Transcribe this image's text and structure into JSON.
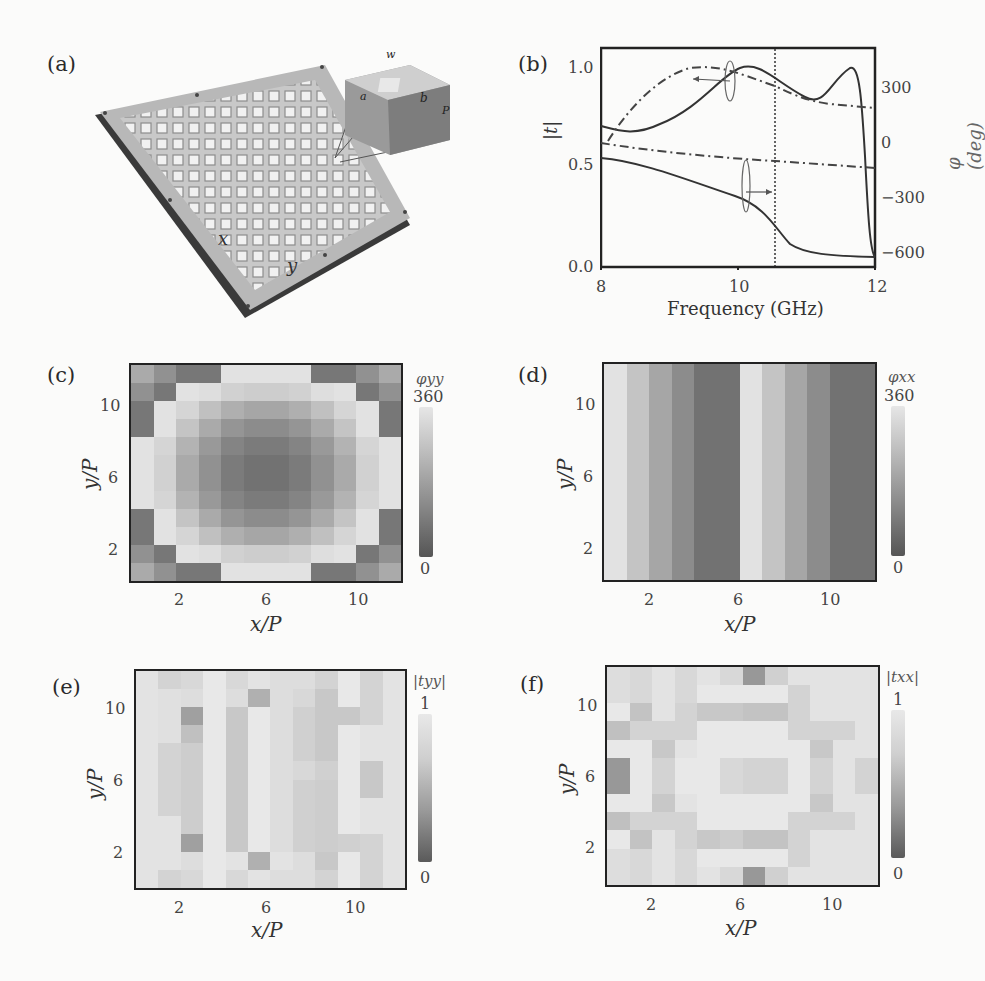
{
  "panels": {
    "a": {
      "label": "(a)",
      "description": "Photograph of fabricated metasurface sample (12x12 unit cells) with inset unit-cell schematic",
      "inset_dimension_labels": [
        "w",
        "a",
        "a'",
        "b",
        "b'",
        "P"
      ],
      "axis_labels": [
        "x",
        "y"
      ]
    },
    "b": {
      "label": "(b)",
      "xlabel": "Frequency (GHz)",
      "ylabel_left": "|t|",
      "ylabel_right": "φ (deg)",
      "xticks": [
        "8",
        "10",
        "12"
      ],
      "yticks_left": [
        "0.0",
        "0.5",
        "1.0"
      ],
      "yticks_right": [
        "300",
        "0",
        "−300",
        "−600"
      ]
    },
    "c": {
      "label": "(c)",
      "xlabel": "x/P",
      "ylabel": "y/P",
      "xticks": [
        "2",
        "6",
        "10"
      ],
      "yticks": [
        "10",
        "6",
        "2"
      ],
      "cbar_title": "φyy",
      "cbar_max": "360",
      "cbar_min": "0"
    },
    "d": {
      "label": "(d)",
      "xlabel": "x/P",
      "ylabel": "y/P",
      "xticks": [
        "2",
        "6",
        "10"
      ],
      "yticks": [
        "10",
        "6",
        "2"
      ],
      "cbar_title": "φxx",
      "cbar_max": "360",
      "cbar_min": "0"
    },
    "e": {
      "label": "(e)",
      "xlabel": "x/P",
      "ylabel": "y/P",
      "xticks": [
        "2",
        "6",
        "10"
      ],
      "yticks": [
        "10",
        "6",
        "2"
      ],
      "cbar_title": "|tyy|",
      "cbar_max": "1",
      "cbar_min": "0"
    },
    "f": {
      "label": "(f)",
      "xlabel": "x/P",
      "ylabel": "y/P",
      "xticks": [
        "2",
        "6",
        "10"
      ],
      "yticks": [
        "10",
        "6",
        "2"
      ],
      "cbar_title": "|txx|",
      "cbar_max": "1",
      "cbar_min": "0"
    }
  },
  "chart_data": [
    {
      "panel": "b",
      "type": "line",
      "title": "",
      "xlabel": "Frequency (GHz)",
      "ylabel": "|t|",
      "ylabel_right": "φ (deg)",
      "xlim": [
        8,
        12
      ],
      "ylim": [
        0,
        1.1
      ],
      "ylim_right": [
        -650,
        500
      ],
      "vline": 10.55,
      "x": [
        8.0,
        8.25,
        8.5,
        8.75,
        9.0,
        9.25,
        9.5,
        9.75,
        10.0,
        10.25,
        10.5,
        10.75,
        11.0,
        11.25,
        11.5,
        11.65,
        11.75,
        11.85,
        12.0
      ],
      "series": [
        {
          "name": "|t| (upper, solid)",
          "axis": "left",
          "style": "solid",
          "values": [
            0.7,
            0.68,
            0.67,
            0.69,
            0.74,
            0.81,
            0.88,
            0.94,
            0.99,
            1.0,
            0.95,
            0.88,
            0.84,
            0.88,
            0.99,
            0.98,
            0.7,
            0.3,
            0.06
          ]
        },
        {
          "name": "φ (upper, dash-dot)",
          "axis": "right",
          "style": "dashdot",
          "values": [
            -20,
            20,
            170,
            290,
            350,
            380,
            390,
            380,
            360,
            340,
            310,
            270,
            250,
            230,
            220,
            215,
            212,
            210,
            210
          ]
        },
        {
          "name": "|t| (lower, solid)",
          "axis": "left",
          "style": "solid",
          "values": [
            0.51,
            0.5,
            0.49,
            0.47,
            0.45,
            0.42,
            0.4,
            0.38,
            0.36,
            0.33,
            0.28,
            0.18,
            0.1,
            0.08,
            0.07,
            0.065,
            0.06,
            0.06,
            0.06
          ]
        },
        {
          "name": "φ (lower, dash-dot)",
          "axis": "right",
          "style": "dashdot",
          "values": [
            -5,
            -20,
            -35,
            -50,
            -65,
            -75,
            -85,
            -95,
            -105,
            -112,
            -118,
            -125,
            -130,
            -135,
            -140,
            -142,
            -145,
            -147,
            -150
          ]
        }
      ],
      "xticks": [
        8,
        10,
        12
      ],
      "yticks_left": [
        0.0,
        0.5,
        1.0
      ],
      "yticks_right": [
        300,
        0,
        -300,
        -600
      ]
    },
    {
      "panel": "c",
      "type": "heatmap",
      "title": "φyy",
      "xlabel": "x/P",
      "ylabel": "y/P",
      "xticks": [
        2,
        6,
        10
      ],
      "yticks": [
        2,
        6,
        10
      ],
      "colorbar": {
        "label": "φyy",
        "min": 0,
        "max": 360
      },
      "rows_top_to_bottom": [
        [
          210,
          150,
          90,
          90,
          340,
          340,
          340,
          340,
          90,
          90,
          150,
          210
        ],
        [
          150,
          90,
          340,
          330,
          300,
          290,
          290,
          300,
          330,
          340,
          90,
          150
        ],
        [
          90,
          340,
          310,
          260,
          220,
          200,
          200,
          220,
          260,
          310,
          340,
          90
        ],
        [
          90,
          340,
          270,
          210,
          160,
          140,
          140,
          160,
          210,
          270,
          340,
          90
        ],
        [
          340,
          310,
          230,
          170,
          120,
          100,
          100,
          120,
          170,
          230,
          310,
          340
        ],
        [
          340,
          300,
          210,
          150,
          100,
          80,
          80,
          100,
          150,
          210,
          300,
          340
        ],
        [
          340,
          300,
          210,
          150,
          100,
          80,
          80,
          100,
          150,
          210,
          300,
          340
        ],
        [
          340,
          310,
          230,
          170,
          120,
          100,
          100,
          120,
          170,
          230,
          310,
          340
        ],
        [
          90,
          340,
          270,
          210,
          160,
          140,
          140,
          160,
          210,
          270,
          340,
          90
        ],
        [
          90,
          340,
          310,
          260,
          220,
          200,
          200,
          220,
          260,
          310,
          340,
          90
        ],
        [
          150,
          90,
          340,
          330,
          300,
          290,
          290,
          300,
          330,
          340,
          90,
          150
        ],
        [
          210,
          150,
          90,
          90,
          340,
          340,
          340,
          340,
          90,
          90,
          150,
          210
        ]
      ]
    },
    {
      "panel": "d",
      "type": "heatmap",
      "title": "φxx",
      "xlabel": "x/P",
      "ylabel": "y/P",
      "xticks": [
        2,
        6,
        10
      ],
      "yticks": [
        2,
        6,
        10
      ],
      "colorbar": {
        "label": "φxx",
        "min": 0,
        "max": 360
      },
      "column_values": [
        340,
        270,
        200,
        140,
        80,
        80,
        340,
        270,
        200,
        140,
        80,
        80
      ]
    },
    {
      "panel": "e",
      "type": "heatmap",
      "title": "|tyy|",
      "xlabel": "x/P",
      "ylabel": "y/P",
      "xticks": [
        2,
        6,
        10
      ],
      "yticks": [
        2,
        6,
        10
      ],
      "colorbar": {
        "label": "|tyy|",
        "min": 0,
        "max": 1
      },
      "rows_top_to_bottom": [
        [
          0.92,
          0.82,
          0.85,
          0.95,
          0.85,
          0.92,
          0.88,
          0.88,
          0.82,
          0.95,
          0.82,
          0.92
        ],
        [
          0.92,
          0.9,
          0.88,
          0.95,
          0.88,
          0.6,
          0.88,
          0.85,
          0.75,
          0.95,
          0.82,
          0.92
        ],
        [
          0.92,
          0.9,
          0.5,
          0.95,
          0.75,
          0.95,
          0.88,
          0.8,
          0.75,
          0.75,
          0.82,
          0.92
        ],
        [
          0.92,
          0.9,
          0.7,
          0.95,
          0.75,
          0.95,
          0.88,
          0.8,
          0.75,
          0.95,
          0.92,
          0.92
        ],
        [
          0.92,
          0.82,
          0.78,
          0.95,
          0.75,
          0.95,
          0.88,
          0.8,
          0.75,
          0.95,
          0.92,
          0.92
        ],
        [
          0.92,
          0.82,
          0.78,
          0.95,
          0.75,
          0.95,
          0.88,
          0.85,
          0.8,
          0.95,
          0.75,
          0.92
        ],
        [
          0.92,
          0.82,
          0.78,
          0.95,
          0.75,
          0.95,
          0.88,
          0.8,
          0.78,
          0.95,
          0.75,
          0.92
        ],
        [
          0.92,
          0.82,
          0.78,
          0.95,
          0.75,
          0.95,
          0.88,
          0.8,
          0.78,
          0.95,
          0.92,
          0.92
        ],
        [
          0.92,
          0.92,
          0.78,
          0.95,
          0.75,
          0.95,
          0.88,
          0.8,
          0.78,
          0.95,
          0.92,
          0.92
        ],
        [
          0.92,
          0.92,
          0.5,
          0.95,
          0.75,
          0.95,
          0.88,
          0.8,
          0.78,
          0.8,
          0.82,
          0.92
        ],
        [
          0.92,
          0.92,
          0.88,
          0.95,
          0.92,
          0.6,
          0.92,
          0.88,
          0.75,
          0.95,
          0.82,
          0.92
        ],
        [
          0.92,
          0.82,
          0.85,
          0.95,
          0.85,
          0.92,
          0.88,
          0.88,
          0.82,
          0.95,
          0.82,
          0.92
        ]
      ]
    },
    {
      "panel": "f",
      "type": "heatmap",
      "title": "|txx|",
      "xlabel": "x/P",
      "ylabel": "y/P",
      "xticks": [
        2,
        6,
        10
      ],
      "yticks": [
        2,
        6,
        10
      ],
      "colorbar": {
        "label": "|txx|",
        "min": 0,
        "max": 1
      },
      "rows_top_to_bottom": [
        [
          0.88,
          0.85,
          0.92,
          0.85,
          0.92,
          0.85,
          0.45,
          0.8,
          0.92,
          0.92,
          0.92,
          0.92
        ],
        [
          0.88,
          0.85,
          0.92,
          0.85,
          0.95,
          0.95,
          0.95,
          0.95,
          0.82,
          0.92,
          0.92,
          0.92
        ],
        [
          0.95,
          0.72,
          0.92,
          0.82,
          0.75,
          0.75,
          0.72,
          0.72,
          0.82,
          0.92,
          0.92,
          0.92
        ],
        [
          0.7,
          0.82,
          0.82,
          0.82,
          0.95,
          0.95,
          0.95,
          0.95,
          0.82,
          0.82,
          0.82,
          0.92
        ],
        [
          0.95,
          0.95,
          0.75,
          0.92,
          0.95,
          0.95,
          0.95,
          0.95,
          0.95,
          0.75,
          0.92,
          0.92
        ],
        [
          0.45,
          0.95,
          0.82,
          0.95,
          0.95,
          0.85,
          0.82,
          0.82,
          0.95,
          0.82,
          0.92,
          0.82
        ],
        [
          0.45,
          0.95,
          0.82,
          0.95,
          0.95,
          0.85,
          0.82,
          0.82,
          0.95,
          0.82,
          0.92,
          0.82
        ],
        [
          0.95,
          0.95,
          0.75,
          0.92,
          0.95,
          0.95,
          0.95,
          0.95,
          0.95,
          0.75,
          0.92,
          0.92
        ],
        [
          0.7,
          0.82,
          0.82,
          0.82,
          0.95,
          0.95,
          0.95,
          0.95,
          0.82,
          0.82,
          0.82,
          0.92
        ],
        [
          0.95,
          0.72,
          0.92,
          0.82,
          0.75,
          0.78,
          0.72,
          0.72,
          0.82,
          0.92,
          0.92,
          0.92
        ],
        [
          0.88,
          0.85,
          0.92,
          0.85,
          0.95,
          0.95,
          0.95,
          0.95,
          0.82,
          0.92,
          0.92,
          0.92
        ],
        [
          0.88,
          0.85,
          0.92,
          0.85,
          0.92,
          0.85,
          0.45,
          0.8,
          0.92,
          0.92,
          0.92,
          0.92
        ]
      ]
    }
  ]
}
